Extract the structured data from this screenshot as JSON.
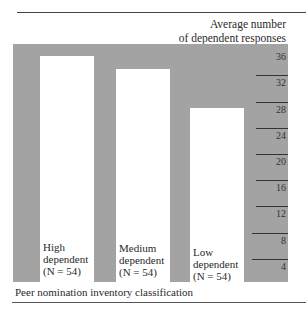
{
  "chart_data": {
    "type": "bar",
    "title": "",
    "xlabel": "Peer nomination inventory classification",
    "ylabel": "Average number of dependent responses",
    "ylabel_lines": [
      "Average number",
      "of dependent responses"
    ],
    "categories": [
      "High dependent (N = 54)",
      "Medium dependent (N = 54)",
      "Low dependent (N = 54)"
    ],
    "category_lines": [
      [
        "High",
        "dependent",
        "(N = 54)"
      ],
      [
        "Medium",
        "dependent",
        "(N = 54)"
      ],
      [
        "Low",
        "dependent",
        "(N = 54)"
      ]
    ],
    "values": [
      35,
      33,
      27
    ],
    "ylim": [
      0,
      36
    ],
    "yticks": [
      4,
      8,
      12,
      16,
      20,
      24,
      28,
      32,
      36
    ],
    "y_axis_position": "right",
    "grid": false,
    "legend": null,
    "colors": {
      "background": "#a3a3a3",
      "bars": "#ffffff"
    }
  }
}
